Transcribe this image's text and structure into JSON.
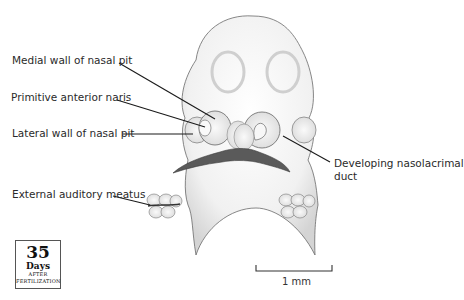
{
  "figure": {
    "labels": {
      "medial_wall": "Medial wall of nasal pit",
      "primitive_naris": "Primitive anterior naris",
      "lateral_wall": "Lateral wall of nasal pit",
      "external_meatus": "External auditory meatus",
      "nasolacrimal_line1": "Developing nasolacrimal",
      "nasolacrimal_line2": "duct"
    },
    "day_badge": {
      "number": "35",
      "unit": "Days",
      "line1": "AFTER",
      "line2": "FERTILIZATION"
    },
    "scale_bar": {
      "label": "1 mm"
    },
    "colors": {
      "outline": "#555555",
      "shading": "#d8d8d8",
      "mouth": "#5a5a5a",
      "leader": "#1a1a1a"
    }
  }
}
